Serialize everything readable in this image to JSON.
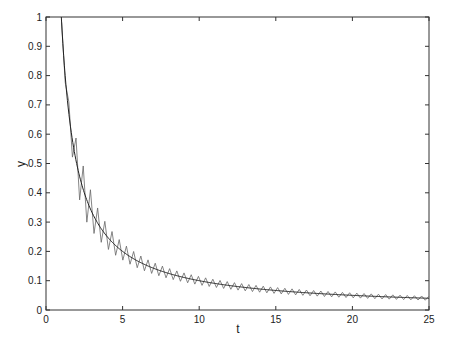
{
  "chart_data": {
    "type": "line",
    "title": "",
    "xlabel": "t",
    "ylabel": "y",
    "xlim": [
      0,
      25
    ],
    "ylim": [
      0,
      1
    ],
    "grid": false,
    "legend": null,
    "xticks": [
      0,
      5,
      10,
      15,
      20,
      25
    ],
    "xtick_labels": [
      "0",
      "5",
      "10",
      "15",
      "20",
      "25"
    ],
    "yticks": [
      0,
      0.1,
      0.2,
      0.3,
      0.4,
      0.5,
      0.6,
      0.7,
      0.8,
      0.9,
      1
    ],
    "ytick_labels": [
      "0",
      "0.1",
      "0.2",
      "0.3",
      "0.4",
      "0.5",
      "0.6",
      "0.7",
      "0.8",
      "0.9",
      "1"
    ],
    "series": [
      {
        "name": "smooth",
        "description": "smooth decaying curve, approximately y = 1/t",
        "color": "#222222",
        "x": [
          1,
          1.5,
          2,
          3,
          4,
          5,
          6,
          8,
          10,
          12,
          15,
          20,
          25
        ],
        "values": [
          1.0,
          0.667,
          0.5,
          0.333,
          0.25,
          0.2,
          0.167,
          0.125,
          0.1,
          0.083,
          0.067,
          0.05,
          0.04
        ]
      },
      {
        "name": "oscillating",
        "description": "oscillating curve around the smooth curve, period about 0.47, amplitude decaying roughly as 0.35/t^2 envelope",
        "color": "#555555",
        "period": 0.47,
        "x": [
          2,
          3,
          4,
          5,
          7,
          10,
          15,
          20,
          25
        ],
        "upper_envelope": [
          0.52,
          0.37,
          0.29,
          0.27,
          0.2,
          0.14,
          0.09,
          0.065,
          0.05
        ],
        "lower_envelope": [
          0.46,
          0.3,
          0.21,
          0.13,
          0.1,
          0.065,
          0.05,
          0.035,
          0.03
        ]
      }
    ]
  },
  "layout": {
    "plot_left": 46,
    "plot_top": 17,
    "plot_right": 429,
    "plot_bottom": 310
  }
}
